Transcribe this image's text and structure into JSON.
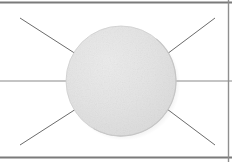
{
  "figure": {
    "name": "radiating-disk-diagram",
    "width": 232,
    "height": 162,
    "background_color": "#ffffff"
  },
  "colors": {
    "background": "#ffffff",
    "disk_fill": "#e2e2e2",
    "disk_fill_light": "#e8e8e8",
    "disk_edge": "#cfcfcf",
    "disk_shadow": "#c8c8c8",
    "ray_line": "#6b6b6b",
    "axis_line": "#8a8a8a",
    "frame_rule": "#7a7a7a"
  },
  "disk": {
    "label": "disk",
    "center_x": 121,
    "center_y": 81,
    "radius": 55,
    "fill": "#e2e2e2",
    "has_shadow": true,
    "shadow_offset_x": 3,
    "shadow_offset_y": 3
  },
  "frame_rules": [
    {
      "label": "top-rule",
      "x1": 0,
      "y1": 2.5,
      "x2": 232,
      "y2": 2.5,
      "width": 2.0,
      "color": "#7a7a7a"
    },
    {
      "label": "bottom-rule",
      "x1": 0,
      "y1": 157.5,
      "x2": 232,
      "y2": 157.5,
      "width": 2.0,
      "color": "#7a7a7a"
    },
    {
      "label": "right-rule",
      "x1": 228.5,
      "y1": 0,
      "x2": 228.5,
      "y2": 162,
      "width": 1.4,
      "color": "#8f8f8f"
    }
  ],
  "axis_segments": [
    {
      "label": "horizontal-axis-left",
      "x1": 0,
      "y1": 81,
      "x2": 67,
      "y2": 81,
      "width": 1.1,
      "color": "#8a8a8a"
    },
    {
      "label": "horizontal-axis-right",
      "x1": 176,
      "y1": 81,
      "x2": 232,
      "y2": 81,
      "width": 1.1,
      "color": "#8a8a8a"
    }
  ],
  "rays": [
    {
      "label": "ray-upper-left",
      "x1": 20,
      "y1": 18,
      "x2": 76,
      "y2": 54,
      "width": 1.0,
      "color": "#6b6b6b"
    },
    {
      "label": "ray-lower-left",
      "x1": 20,
      "y1": 145,
      "x2": 76,
      "y2": 109,
      "width": 1.0,
      "color": "#6b6b6b"
    },
    {
      "label": "ray-upper-right",
      "x1": 167,
      "y1": 54,
      "x2": 215,
      "y2": 18,
      "width": 1.0,
      "color": "#6b6b6b"
    },
    {
      "label": "ray-lower-right",
      "x1": 167,
      "y1": 109,
      "x2": 215,
      "y2": 145,
      "width": 1.0,
      "color": "#6b6b6b"
    }
  ]
}
